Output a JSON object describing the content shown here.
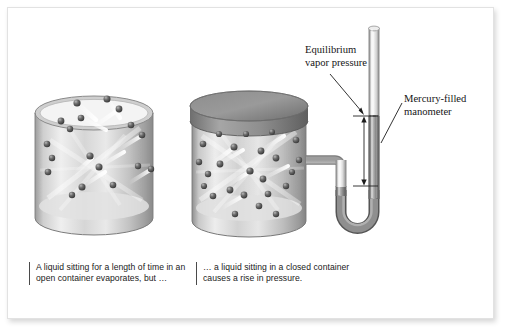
{
  "figure": {
    "background_color": "#ffffff",
    "frame_border_color": "#e2e2e2"
  },
  "annotations": [
    {
      "id": "equilibrium-vapor-pressure",
      "text": "Equilibrium vapor pressure",
      "font_style": "serif",
      "leader": {
        "has_arrowhead": true,
        "from": [
          346,
          76
        ],
        "to": [
          371,
          113
        ]
      }
    },
    {
      "id": "mercury-filled-manometer",
      "text": "Mercury-filled manometer",
      "font_style": "serif",
      "leader": {
        "has_arrowhead": false,
        "from": [
          402,
          104
        ],
        "to": [
          382,
          143
        ]
      }
    }
  ],
  "captions": {
    "open_container": "A liquid sitting for a length of time in an open container evaporates, but …",
    "closed_container": "… a liquid sitting in a closed container causes a rise in pressure."
  },
  "diagram": {
    "type": "illustration",
    "open_beaker": {
      "name": "open-container",
      "lid": "none",
      "molecule_count": 18,
      "note": "molecules escape upward out of the open top"
    },
    "closed_beaker": {
      "name": "closed-container",
      "lid": "sealed-dark-lid",
      "molecule_count": 24,
      "note": "molecules rebound off sealed lid; vapor pressure builds"
    },
    "manometer": {
      "name": "mercury-filled-manometer",
      "fluid": "mercury",
      "shape": "u-tube",
      "mercury_color": "#8e8e8e",
      "glass_color": "#d9d9d9",
      "height_difference_marker": {
        "type": "double-headed-vertical-arrow",
        "top_y": 116,
        "bottom_y": 186,
        "tick_marks": 2
      }
    }
  },
  "colors": {
    "ink": "#151515",
    "caption_rule": "#4a4a4a",
    "metal_light": "#e8e8e8",
    "metal_mid": "#b8b8b8",
    "metal_dark": "#6f6f6f",
    "molecule": "#4a4a4a"
  }
}
